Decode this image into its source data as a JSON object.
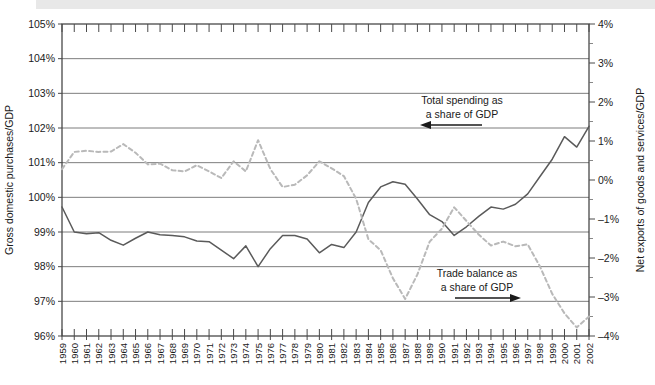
{
  "chart_data": {
    "type": "line",
    "title": "",
    "subtitle": "",
    "xlabel": "",
    "ylabel": "Gross domestic purchases/GDP",
    "y2label": "Net exports of goods and services/GDP",
    "ylim": [
      96,
      105
    ],
    "y2lim": [
      -4,
      4
    ],
    "yticks": [
      "96%",
      "97%",
      "98%",
      "99%",
      "100%",
      "101%",
      "102%",
      "103%",
      "104%",
      "105%"
    ],
    "ytick_values": [
      96,
      97,
      98,
      99,
      100,
      101,
      102,
      103,
      104,
      105
    ],
    "y2ticks": [
      "-4%",
      "-3%",
      "-2%",
      "-1%",
      "0%",
      "1%",
      "2%",
      "3%",
      "4%"
    ],
    "y2tick_values": [
      -4,
      -3,
      -2,
      -1,
      0,
      1,
      2,
      3,
      4
    ],
    "grid": true,
    "legend_position": "inline-annotations",
    "x": [
      1959,
      1960,
      1961,
      1962,
      1963,
      1964,
      1965,
      1966,
      1967,
      1968,
      1969,
      1970,
      1971,
      1972,
      1973,
      1974,
      1975,
      1976,
      1977,
      1978,
      1979,
      1980,
      1981,
      1982,
      1983,
      1984,
      1985,
      1986,
      1987,
      1988,
      1989,
      1990,
      1991,
      1992,
      1993,
      1994,
      1995,
      1996,
      1997,
      1998,
      1999,
      2000,
      2001,
      2002
    ],
    "xticklabels": [
      "1959",
      "1960",
      "1961",
      "1962",
      "1963",
      "1964",
      "1965",
      "1966",
      "1967",
      "1968",
      "1969",
      "1970",
      "1971",
      "1972",
      "1973",
      "1974",
      "1975",
      "1976",
      "1977",
      "1978",
      "1979",
      "1980",
      "1981",
      "1982",
      "1983",
      "1984",
      "1985",
      "1986",
      "1987",
      "1988",
      "1989",
      "1990",
      "1991",
      "1992",
      "1993",
      "1994",
      "1995",
      "1996",
      "1997",
      "1998",
      "1999",
      "2000",
      "2001",
      "2002"
    ],
    "series": [
      {
        "name": "Total spending as a share of GDP",
        "axis": "left",
        "style": "solid",
        "color": "#5a5a5a",
        "values": [
          99.72,
          99.0,
          98.95,
          98.98,
          98.76,
          98.62,
          98.82,
          99.0,
          98.92,
          98.9,
          98.86,
          98.74,
          98.72,
          98.48,
          98.23,
          98.6,
          98.0,
          98.52,
          98.9,
          98.9,
          98.8,
          98.4,
          98.64,
          98.55,
          99.0,
          99.85,
          100.3,
          100.45,
          100.38,
          99.95,
          99.5,
          99.3,
          98.9,
          99.15,
          99.45,
          99.72,
          99.66,
          99.8,
          100.1,
          100.6,
          101.1,
          101.75,
          101.45,
          102.05
        ]
      },
      {
        "name": "Trade balance as a share of GDP",
        "axis": "right",
        "style": "dashed",
        "color": "#b9b9b9",
        "values": [
          0.28,
          0.72,
          0.75,
          0.72,
          0.73,
          0.92,
          0.7,
          0.4,
          0.42,
          0.25,
          0.22,
          0.38,
          0.22,
          0.05,
          0.48,
          0.22,
          1.02,
          0.28,
          -0.18,
          -0.12,
          0.12,
          0.48,
          0.3,
          0.1,
          -0.48,
          -1.52,
          -1.8,
          -2.52,
          -3.05,
          -2.42,
          -1.58,
          -1.25,
          -0.7,
          -1.05,
          -1.4,
          -1.68,
          -1.58,
          -1.7,
          -1.65,
          -2.22,
          -2.92,
          -3.42,
          -3.78,
          -3.5
        ]
      }
    ],
    "annotations": [
      {
        "id": "total-spending-annotation",
        "line1": "Total spending as",
        "line2": "a share of GDP",
        "arrow": "left"
      },
      {
        "id": "trade-balance-annotation",
        "line1": "Trade balance as",
        "line2": "a share of GDP",
        "arrow": "right"
      }
    ]
  }
}
